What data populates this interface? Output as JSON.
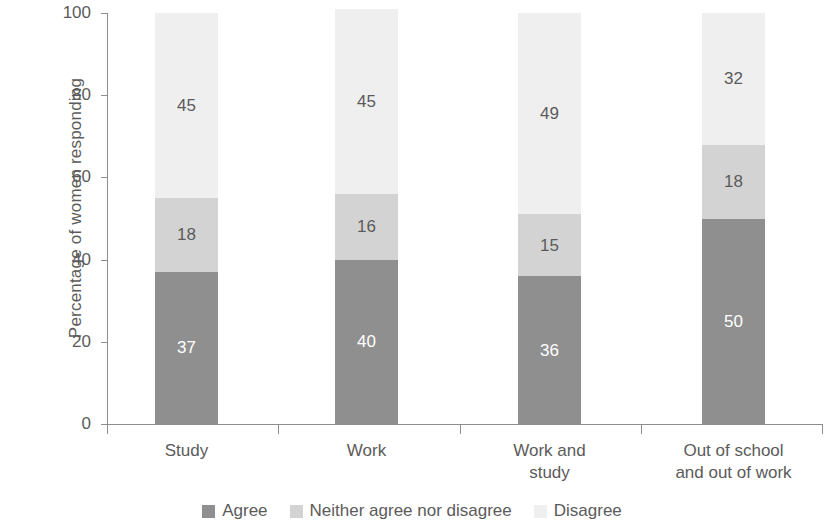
{
  "chart_data": {
    "type": "bar",
    "subtype": "stacked-bar-100",
    "title": "",
    "xlabel": "",
    "ylabel": "Percentage of women responding",
    "ylim": [
      0,
      100
    ],
    "yticks": [
      0,
      20,
      40,
      60,
      80,
      100
    ],
    "ytick_labels": [
      "0",
      "20",
      "40",
      "60",
      "80",
      "100"
    ],
    "grid": false,
    "legend_position": "bottom",
    "categories": [
      "Study",
      "Work",
      "Work and study",
      "Out of school and out of work"
    ],
    "category_lines": [
      [
        "Study"
      ],
      [
        "Work"
      ],
      [
        "Work and",
        "study"
      ],
      [
        "Out of school",
        "and out of work"
      ]
    ],
    "series": [
      {
        "name": "Agree",
        "color": "#8f8f8f",
        "values": [
          37,
          40,
          36,
          50
        ]
      },
      {
        "name": "Neither agree nor disagree",
        "color": "#d3d3d3",
        "values": [
          18,
          16,
          15,
          18
        ]
      },
      {
        "name": "Disagree",
        "color": "#efefef",
        "values": [
          45,
          45,
          49,
          32
        ]
      }
    ],
    "bar_totals": [
      100,
      101,
      100,
      100
    ],
    "axis_color": "#8d8d8d",
    "text_color": "#5b5b5b"
  },
  "legend": {
    "items": [
      {
        "label": "Agree",
        "color": "#8f8f8f"
      },
      {
        "label": "Neither agree nor disagree",
        "color": "#d3d3d3"
      },
      {
        "label": "Disagree",
        "color": "#efefef"
      }
    ]
  }
}
